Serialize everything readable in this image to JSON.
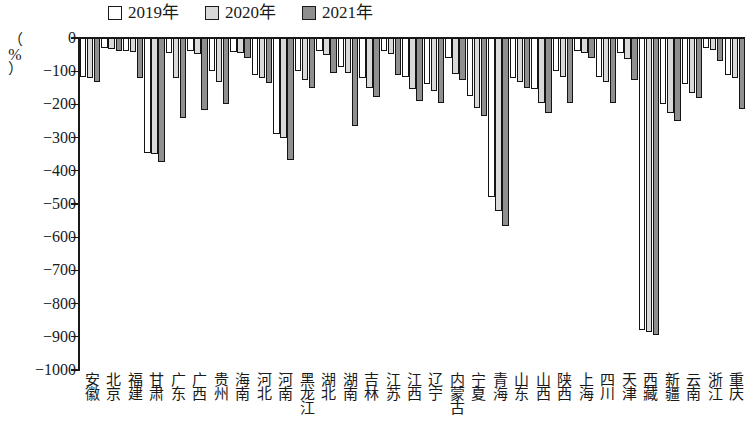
{
  "legend": {
    "position": "top-center",
    "entries": [
      {
        "label": "2019年",
        "fill": "#ffffff",
        "name": "legend-2019"
      },
      {
        "label": "2020年",
        "fill": "#d9d9d9",
        "name": "legend-2020"
      },
      {
        "label": "2021年",
        "fill": "#8f8f8f",
        "name": "legend-2021"
      }
    ]
  },
  "axis": {
    "y_title_open": "（",
    "y_title_unit": "%",
    "y_title_close": "）",
    "y_ticks": [
      "0",
      "−100",
      "−200",
      "−300",
      "−400",
      "−500",
      "−600",
      "−700",
      "−800",
      "−900",
      "−1000"
    ]
  },
  "chart_data": {
    "type": "bar",
    "title": "",
    "subtitle": "",
    "xlabel": "",
    "ylabel": "%",
    "ylim": [
      -1000,
      0
    ],
    "ytick_values": [
      0,
      -100,
      -200,
      -300,
      -400,
      -500,
      -600,
      -700,
      -800,
      -900,
      -1000
    ],
    "grid": false,
    "legend_position": "top-center",
    "categories": [
      "安徽",
      "北京",
      "福建",
      "甘肃",
      "广东",
      "广西",
      "贵州",
      "海南",
      "河北",
      "河南",
      "黑龙江",
      "湖北",
      "湖南",
      "吉林",
      "江苏",
      "江西",
      "辽宁",
      "内蒙古",
      "宁夏",
      "青海",
      "山东",
      "山西",
      "陕西",
      "上海",
      "四川",
      "天津",
      "西藏",
      "新疆",
      "云南",
      "浙江",
      "重庆"
    ],
    "series": [
      {
        "name": "2019年",
        "fill": "#ffffff",
        "values": [
          -118,
          -30,
          -38,
          -345,
          -45,
          -40,
          -98,
          -42,
          -110,
          -290,
          -100,
          -40,
          -86,
          -120,
          -40,
          -118,
          -140,
          -60,
          -175,
          -480,
          -120,
          -155,
          -100,
          -38,
          -118,
          -45,
          -880,
          -200,
          -140,
          -30,
          -110
        ]
      },
      {
        "name": "2020年",
        "fill": "#d9d9d9",
        "values": [
          -120,
          -34,
          -42,
          -350,
          -120,
          -48,
          -132,
          -46,
          -120,
          -300,
          -128,
          -52,
          -105,
          -150,
          -48,
          -155,
          -160,
          -108,
          -210,
          -520,
          -132,
          -195,
          -118,
          -44,
          -132,
          -62,
          -885,
          -225,
          -165,
          -36,
          -120
        ]
      },
      {
        "name": "2021年",
        "fill": "#8f8f8f",
        "values": [
          -132,
          -38,
          -120,
          -372,
          -240,
          -218,
          -200,
          -60,
          -135,
          -368,
          -150,
          -105,
          -265,
          -178,
          -110,
          -190,
          -195,
          -125,
          -235,
          -565,
          -150,
          -225,
          -195,
          -60,
          -195,
          -125,
          -895,
          -250,
          -180,
          -70,
          -215
        ]
      }
    ]
  }
}
